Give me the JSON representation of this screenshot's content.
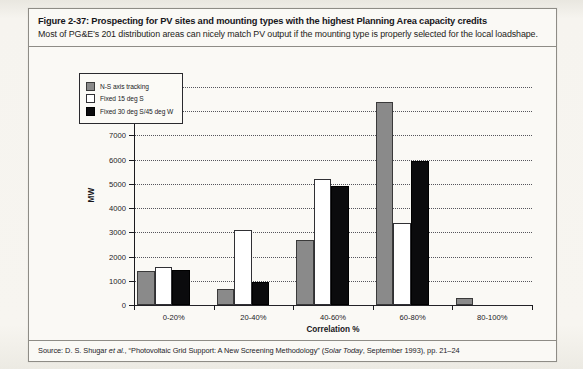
{
  "figure": {
    "title": "Figure 2-37: Prospecting for PV sites and mounting types with the highest Planning Area capacity credits",
    "subtitle": "Most of PG&E’s 201 distribution areas can nicely match PV output if the mounting type is properly selected for the local loadshape.",
    "source_prefix": "Source: D. S. Shugar ",
    "source_etal": "et al.",
    "source_mid": ", “Photovoltaic Grid Support: A New Screening Methodology” (",
    "source_italic": "Solar Today",
    "source_suffix": ", September 1993), pp. 21–24"
  },
  "chart_data": {
    "type": "bar",
    "title": "",
    "xlabel": "Correlation %",
    "ylabel": "MW",
    "categories": [
      "0-20%",
      "20-40%",
      "40-60%",
      "60-80%",
      "80-100%"
    ],
    "series": [
      {
        "name": "N-S axis tracking",
        "color": "#8a8a8a",
        "values": [
          1400,
          650,
          2700,
          8380,
          300
        ]
      },
      {
        "name": "Fixed 15 deg S",
        "color": "#ffffff",
        "values": [
          1550,
          3100,
          5200,
          3380,
          0
        ]
      },
      {
        "name": "Fixed 30 deg S/45 deg W",
        "color": "#0b0b0d",
        "values": [
          1450,
          930,
          4920,
          5930,
          0
        ]
      }
    ],
    "ylim": [
      0,
      9000
    ],
    "yticks": [
      0,
      1000,
      2000,
      3000,
      4000,
      5000,
      6000,
      7000,
      8000,
      9000
    ],
    "ytick_labels": [
      "0",
      "1000",
      "2000",
      "3000",
      "4000",
      "5000",
      "6000",
      "7000",
      "8000",
      "9000"
    ],
    "grid": true,
    "legend_position": "upper-left-inside"
  }
}
